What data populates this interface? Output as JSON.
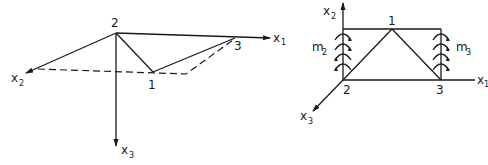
{
  "figure": {
    "left_diagram": {
      "description": "3D truss view with three nodes and axes",
      "nodes": [
        {
          "id": "1",
          "label": "1"
        },
        {
          "id": "2",
          "label": "2"
        },
        {
          "id": "3",
          "label": "3"
        }
      ],
      "axes": {
        "x1": {
          "base": "x",
          "sub": "1"
        },
        "x2": {
          "base": "x",
          "sub": "2"
        },
        "x3": {
          "base": "x",
          "sub": "3"
        }
      }
    },
    "right_diagram": {
      "description": "Planar truss with rotational springs at supports",
      "nodes": [
        {
          "id": "1",
          "label": "1"
        },
        {
          "id": "2",
          "label": "2"
        },
        {
          "id": "3",
          "label": "3"
        }
      ],
      "axes": {
        "x1": {
          "base": "x",
          "sub": "1"
        },
        "x2": {
          "base": "x",
          "sub": "2"
        },
        "x3": {
          "base": "x",
          "sub": "3"
        }
      },
      "springs": {
        "m2": {
          "base": "m",
          "sub": "2"
        },
        "m3": {
          "base": "m",
          "sub": "3"
        }
      }
    }
  }
}
